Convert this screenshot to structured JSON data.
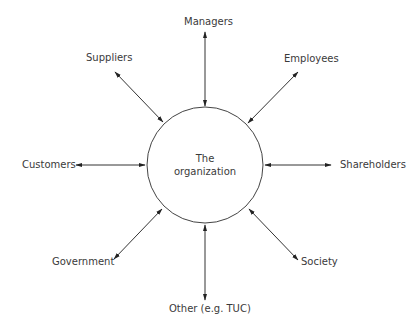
{
  "diagram": {
    "type": "stakeholder-hub",
    "center": {
      "line1": "The",
      "line2": "organization",
      "cx": 205,
      "cy": 165,
      "r": 58
    },
    "stakeholders": [
      {
        "id": "managers",
        "label": "Managers",
        "direction": "top"
      },
      {
        "id": "employees",
        "label": "Employees",
        "direction": "top-right"
      },
      {
        "id": "shareholders",
        "label": "Shareholders",
        "direction": "right"
      },
      {
        "id": "society",
        "label": "Society",
        "direction": "bottom-right"
      },
      {
        "id": "other",
        "label": "Other (e.g. TUC)",
        "direction": "bottom"
      },
      {
        "id": "government",
        "label": "Government",
        "direction": "bottom-left"
      },
      {
        "id": "customers",
        "label": "Customers",
        "direction": "left"
      },
      {
        "id": "suppliers",
        "label": "Suppliers",
        "direction": "top-left"
      }
    ],
    "arrow_style": "double-headed",
    "line_color": "#333333",
    "text_color": "#3a3a3a"
  }
}
